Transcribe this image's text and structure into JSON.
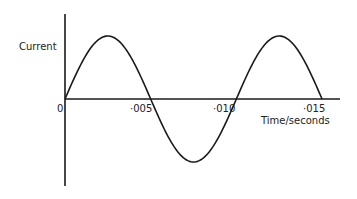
{
  "chart_data": {
    "type": "line",
    "title": "",
    "xlabel": "Time/seconds",
    "ylabel": "Current",
    "xlim": [
      0,
      0.0163
    ],
    "ylim": [
      -1.35,
      1.35
    ],
    "grid": false,
    "legend": null,
    "x_ticks": [
      0,
      0.005,
      0.01,
      0.015
    ],
    "x_tick_labels": [
      "0",
      "·005",
      "·010",
      "·015"
    ],
    "y_ticks": [],
    "series": [
      {
        "name": "Current (sinusoidal AC)",
        "function": "sin",
        "amplitude": 1,
        "period_seconds": 0.0102,
        "x_start": 0,
        "x_end": 0.0153,
        "x": [
          0,
          0.00128,
          0.00255,
          0.00383,
          0.0051,
          0.00638,
          0.00765,
          0.00893,
          0.0102,
          0.01148,
          0.01275,
          0.01403,
          0.0153
        ],
        "values": [
          0,
          0.707,
          1,
          0.707,
          0,
          -0.707,
          -1,
          -0.707,
          0,
          0.707,
          1,
          0.707,
          0
        ]
      }
    ]
  },
  "labels": {
    "y_axis": "Current",
    "x_axis": "Time/seconds",
    "origin": "0",
    "tick_005": "·005",
    "tick_010": "·010",
    "tick_015": "·015"
  },
  "colors": {
    "line": "#1a1a1a",
    "axis": "#1a1a1a",
    "background": "#ffffff"
  }
}
